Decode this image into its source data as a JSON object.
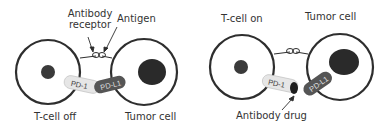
{
  "left_panel": {
    "labels": {
      "antibody_receptor_line1": "Antibody",
      "antibody_receptor_line2": "receptor",
      "antigen": "Antigen",
      "tcell": "T-cell off",
      "tumor": "Tumor cell"
    },
    "pd1": "PD-1",
    "pdl1": "PD-L1"
  },
  "right_panel": {
    "labels": {
      "tcell": "T-cell on",
      "tumor": "Tumor cell",
      "antibody_drug": "Antibody drug"
    },
    "pd1": "PD-1",
    "pdl1": "PD-L1"
  },
  "colors": {
    "membrane": "#2e2e2e",
    "nucleus": "#3a3a3a",
    "pd1_fill": "#e6e6e6",
    "pdl1_fill": "#555555",
    "drug": "#1e1e1e",
    "text": "#333333"
  }
}
